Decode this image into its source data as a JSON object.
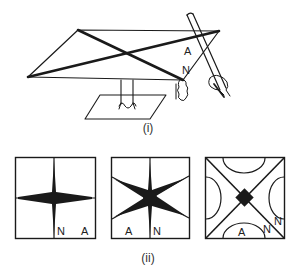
{
  "figure": {
    "part_i": {
      "caption": "(i)",
      "labels": {
        "antinode": "A",
        "node": "N"
      }
    },
    "part_ii": {
      "caption": "(ii)",
      "patterns": [
        {
          "name": "cross-pattern",
          "labels": [
            "N",
            "A"
          ]
        },
        {
          "name": "six-ray-star-pattern",
          "labels": [
            "A",
            "N"
          ]
        },
        {
          "name": "diagonal-x-with-arcs-pattern",
          "labels": [
            "A",
            "N",
            "N"
          ]
        }
      ]
    }
  },
  "colors": {
    "ink": "#1a1a1a",
    "background": "#ffffff"
  }
}
